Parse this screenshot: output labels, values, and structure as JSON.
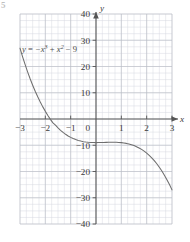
{
  "figure": {
    "mark": "5",
    "background_color": "#ffffff"
  },
  "chart_data": {
    "type": "line",
    "title": "",
    "subtitle": "",
    "xlabel": "x",
    "ylabel": "y",
    "equation_label": {
      "lhs": "y",
      "equals": " = ",
      "term1_base": "−x",
      "term1_exp": "3",
      "term2_op": " + ",
      "term2_base": "x",
      "term2_exp": "2",
      "term3": " − 9",
      "plain": "y = −x³ + x² − 9",
      "at_x": -2.72,
      "at_y": 26.5
    },
    "expression": "y = -x^3 + x^2 - 9",
    "xlim": [
      -3,
      3
    ],
    "ylim": [
      -40,
      40
    ],
    "x_major_ticks": [
      -3,
      -2,
      -1,
      0,
      1,
      2,
      3
    ],
    "y_major_ticks": [
      40,
      30,
      20,
      10,
      0,
      -10,
      -20,
      -30,
      -40
    ],
    "x_tick_labels": [
      "−3",
      "−2",
      "−1",
      "0",
      "1",
      "2",
      "3"
    ],
    "y_tick_labels": [
      "40",
      "30",
      "20",
      "10",
      "0",
      "−10",
      "−20",
      "−30",
      "−40"
    ],
    "x_minor_step": 0.25,
    "y_minor_step": 2.5,
    "grid": true,
    "grid_minor_color": "#d6d9e0",
    "grid_major_color": "#b9bcc4",
    "axis_color": "#555555",
    "curve_color": "#6e6e6e",
    "legend": "none",
    "axis_arrows": [
      "x-positive",
      "y-positive"
    ],
    "x_intercepts": [
      -1.8608
    ],
    "y_intercept": -9,
    "series": [
      {
        "name": "y = -x^3 + x^2 - 9",
        "x": [
          -3,
          -2.9,
          -2.8,
          -2.7,
          -2.6,
          -2.5,
          -2.4,
          -2.3,
          -2.2,
          -2.1,
          -2,
          -1.9,
          -1.8,
          -1.7,
          -1.6,
          -1.5,
          -1.4,
          -1.3,
          -1.2,
          -1.1,
          -1,
          -0.9,
          -0.8,
          -0.7,
          -0.6,
          -0.5,
          -0.4,
          -0.3,
          -0.2,
          -0.1,
          0,
          0.1,
          0.2,
          0.3,
          0.4,
          0.5,
          0.6,
          0.7,
          0.8,
          0.9,
          1,
          1.1,
          1.2,
          1.3,
          1.4,
          1.5,
          1.6,
          1.7,
          1.8,
          1.9,
          2,
          2.1,
          2.2,
          2.3,
          2.4,
          2.5,
          2.6,
          2.7,
          2.8,
          2.9,
          3
        ],
        "y": [
          27,
          23.79,
          20.78,
          17.97,
          15.34,
          12.88,
          10.58,
          8.45,
          6.46,
          4.62,
          2.91,
          1.33,
          -0.13,
          -1.49,
          -2.34,
          -3.38,
          -4.3,
          -5.11,
          -5.83,
          -6.46,
          -7,
          -7.46,
          -7.85,
          -8.17,
          -8.42,
          -8.63,
          -8.78,
          -8.88,
          -8.95,
          -8.99,
          -9,
          -8.99,
          -8.97,
          -8.94,
          -8.9,
          -8.88,
          -8.86,
          -8.85,
          -8.87,
          -8.92,
          -9,
          -9.12,
          -9.29,
          -9.51,
          -9.78,
          -10.13,
          -10.54,
          -11.02,
          -11.59,
          -12.25,
          -13,
          -13.85,
          -14.81,
          -15.87,
          -17.06,
          -18.38,
          -19.82,
          -21.4,
          -23.12,
          -24.99,
          -27
        ]
      }
    ]
  }
}
